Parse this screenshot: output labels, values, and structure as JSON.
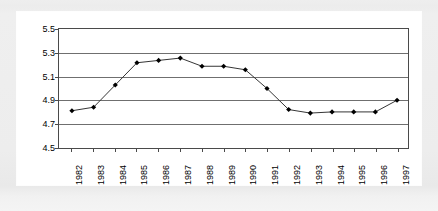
{
  "chart_data": {
    "type": "line",
    "title": "",
    "subtitle": "",
    "xlabel": "",
    "ylabel": "",
    "categories": [
      "1982",
      "1983",
      "1984",
      "1985",
      "1986",
      "1987",
      "1988",
      "1989",
      "1990",
      "1991",
      "1992",
      "1993",
      "1994",
      "1995",
      "1996",
      "1997"
    ],
    "values": [
      4.81,
      4.84,
      5.03,
      5.22,
      5.24,
      5.26,
      5.19,
      5.19,
      5.16,
      5.0,
      4.82,
      4.79,
      4.8,
      4.8,
      4.8,
      4.9
    ],
    "series": [
      {
        "name": "",
        "values": [
          4.81,
          4.84,
          5.03,
          5.22,
          5.24,
          5.26,
          5.19,
          5.19,
          5.16,
          5.0,
          4.82,
          4.79,
          4.8,
          4.8,
          4.8,
          4.9
        ]
      }
    ],
    "ylim": [
      4.5,
      5.5
    ],
    "ytick_values": [
      5.5,
      5.3,
      5.1,
      4.9,
      4.7,
      4.5
    ],
    "ytick_labels": [
      "5.5",
      "5.3",
      "5.1",
      "4.9",
      "4.7",
      "4.5"
    ],
    "xtick_labels": [
      "1982",
      "1983",
      "1984",
      "1985",
      "1986",
      "1987",
      "1988",
      "1989",
      "1990",
      "1991",
      "1992",
      "1993",
      "1994",
      "1995",
      "1996",
      "1997"
    ],
    "grid": "horizontal",
    "legend": "none",
    "marker": "diamond",
    "line_color": "#333333",
    "marker_color": "#000000",
    "grid_color": "#6f6f6f",
    "frame_color": "#4a4a4a",
    "plot_background": "#ffffff",
    "page_background": "#ededed",
    "xtick_label_rotation": -90,
    "annotations": []
  }
}
